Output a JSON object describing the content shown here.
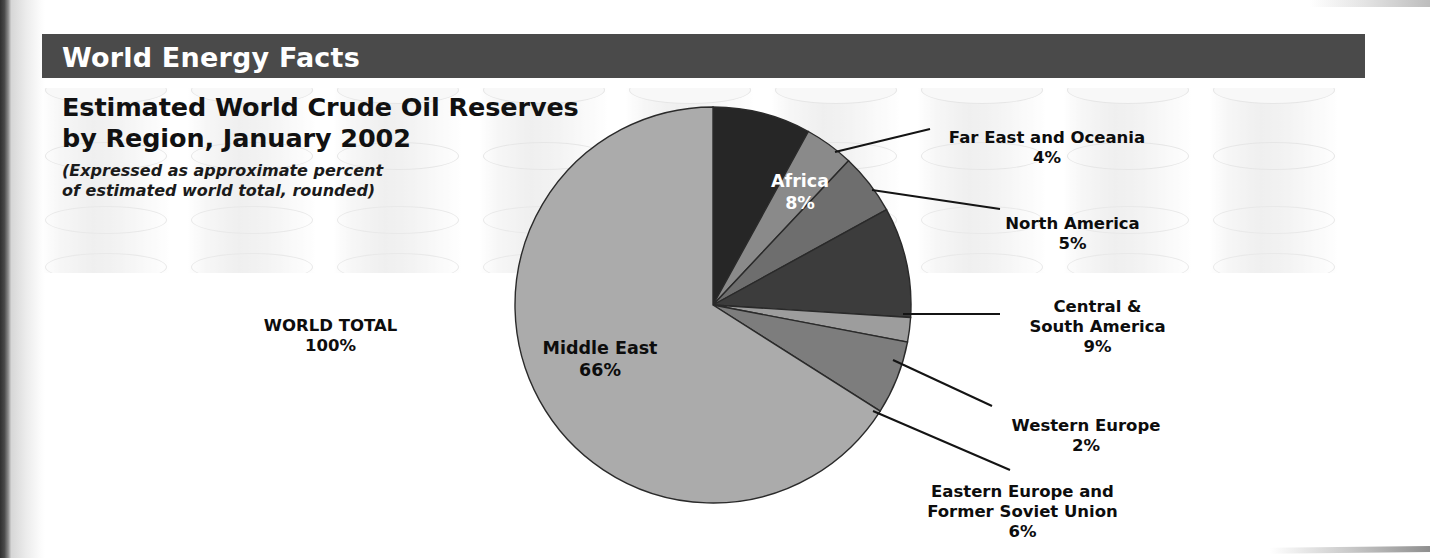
{
  "header": {
    "bar_title": "World Energy Facts",
    "bar_color": "#4a4a4a"
  },
  "chart_heading": {
    "title": "Estimated World Crude Oil Reserves\nby Region, January 2002",
    "subtitle": "(Expressed as approximate percent\nof estimated world total, rounded)"
  },
  "summary": {
    "world_total_label": "WORLD TOTAL",
    "world_total_value": "100%"
  },
  "chart_data": {
    "type": "pie",
    "title": "Estimated World Crude Oil Reserves by Region, January 2002",
    "subtitle": "(Expressed as approximate percent of estimated world total, rounded)",
    "unit": "percent of estimated world total",
    "total_label": "WORLD TOTAL",
    "total_value": 100,
    "legend": "none (direct labels with leader lines)",
    "start_angle_deg": 0,
    "direction": "clockwise",
    "categories": [
      "Africa",
      "Far East and Oceania",
      "North America",
      "Central & South America",
      "Western Europe",
      "Eastern Europe and Former Soviet Union",
      "Middle East"
    ],
    "values": [
      8,
      4,
      5,
      9,
      2,
      6,
      66
    ],
    "colors": [
      "#262626",
      "#8a8a8a",
      "#6e6e6e",
      "#3c3c3c",
      "#9d9d9d",
      "#7d7d7d",
      "#ababab"
    ],
    "slices": [
      {
        "label": "Africa",
        "value": 8,
        "display": "8%",
        "color": "#262626",
        "label_color": "#ffffff",
        "placement": "inside"
      },
      {
        "label": "Far East and Oceania",
        "value": 4,
        "display": "4%",
        "color": "#8a8a8a",
        "label_color": "#0d0d0d",
        "placement": "outside"
      },
      {
        "label": "North America",
        "value": 5,
        "display": "5%",
        "color": "#6e6e6e",
        "label_color": "#0d0d0d",
        "placement": "outside"
      },
      {
        "label": "Central &\nSouth America",
        "value": 9,
        "display": "9%",
        "color": "#3c3c3c",
        "label_color": "#0d0d0d",
        "placement": "outside"
      },
      {
        "label": "Western Europe",
        "value": 2,
        "display": "2%",
        "color": "#9d9d9d",
        "label_color": "#0d0d0d",
        "placement": "outside"
      },
      {
        "label": "Eastern Europe and\nFormer Soviet Union",
        "value": 6,
        "display": "6%",
        "color": "#7d7d7d",
        "label_color": "#0d0d0d",
        "placement": "outside"
      },
      {
        "label": "Middle East",
        "value": 66,
        "display": "66%",
        "color": "#ababab",
        "label_color": "#0d0d0d",
        "placement": "inside"
      }
    ]
  },
  "labels": {
    "africa": {
      "name": "Africa",
      "pct": "8%"
    },
    "far_east": {
      "name": "Far East and Oceania",
      "pct": "4%"
    },
    "north_america": {
      "name": "North America",
      "pct": "5%"
    },
    "central_south_america": {
      "name": "Central &\nSouth America",
      "pct": "9%"
    },
    "western_europe": {
      "name": "Western Europe",
      "pct": "2%"
    },
    "eastern_europe": {
      "name": "Eastern Europe and\nFormer Soviet Union",
      "pct": "6%"
    },
    "middle_east": {
      "name": "Middle East",
      "pct": "66%"
    }
  }
}
